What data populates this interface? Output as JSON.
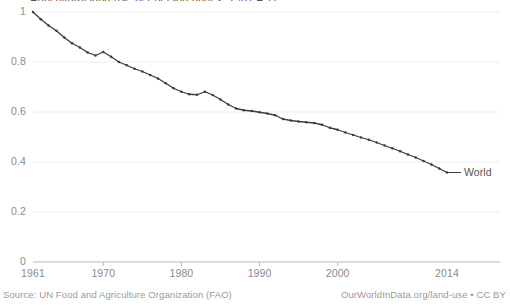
{
  "chart_data": {
    "type": "line",
    "title": "Agricultural land use per person (index, 1961 = 1)",
    "xlabel": "",
    "ylabel": "",
    "xlim": [
      1961,
      2014
    ],
    "ylim": [
      0,
      1
    ],
    "grid": true,
    "legend_position": "right-end-label",
    "series": [
      {
        "name": "World",
        "color": "#3c3c3c",
        "x": [
          1961,
          1962,
          1963,
          1964,
          1965,
          1966,
          1967,
          1968,
          1969,
          1970,
          1971,
          1972,
          1973,
          1974,
          1975,
          1976,
          1977,
          1978,
          1979,
          1980,
          1981,
          1982,
          1983,
          1984,
          1985,
          1986,
          1987,
          1988,
          1989,
          1990,
          1991,
          1992,
          1993,
          1994,
          1995,
          1996,
          1997,
          1998,
          1999,
          2000,
          2001,
          2002,
          2003,
          2004,
          2005,
          2006,
          2007,
          2008,
          2009,
          2010,
          2011,
          2012,
          2013,
          2014
        ],
        "values": [
          1.0,
          0.971,
          0.946,
          0.925,
          0.898,
          0.875,
          0.858,
          0.838,
          0.826,
          0.84,
          0.821,
          0.8,
          0.787,
          0.773,
          0.762,
          0.748,
          0.734,
          0.715,
          0.695,
          0.681,
          0.671,
          0.669,
          0.681,
          0.668,
          0.65,
          0.63,
          0.614,
          0.607,
          0.604,
          0.599,
          0.594,
          0.587,
          0.572,
          0.566,
          0.562,
          0.559,
          0.556,
          0.549,
          0.537,
          0.529,
          0.518,
          0.508,
          0.498,
          0.489,
          0.478,
          0.466,
          0.455,
          0.443,
          0.43,
          0.418,
          0.404,
          0.39,
          0.374,
          0.358
        ]
      }
    ],
    "y_ticks": [
      0,
      0.2,
      0.4,
      0.6,
      0.8,
      1
    ],
    "y_tick_labels": [
      "0",
      "0.2",
      "0.4",
      "0.6",
      "0.8",
      "1"
    ],
    "x_ticks": [
      1961,
      1970,
      1980,
      1990,
      2000,
      2014
    ],
    "x_tick_labels": [
      "1961",
      "1970",
      "1980",
      "1990",
      "2000",
      "2014"
    ]
  },
  "footer": {
    "source": "Source: UN Food and Agriculture Organization (FAO)",
    "attribution": "OurWorldInData.org/land-use • CC BY"
  }
}
